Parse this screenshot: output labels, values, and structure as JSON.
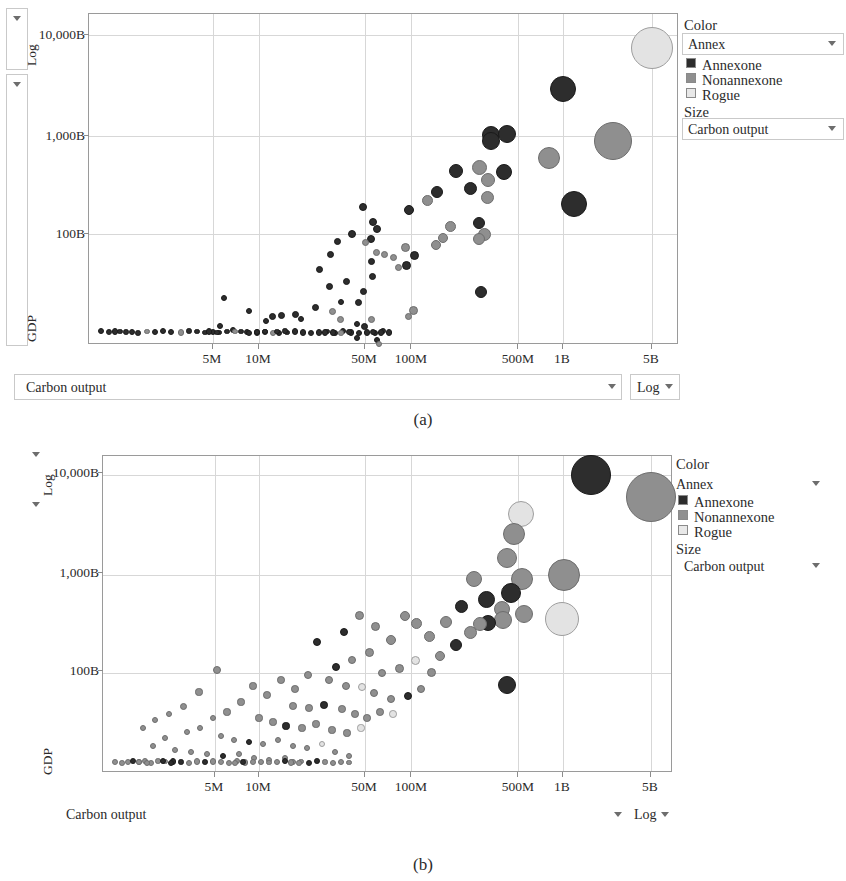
{
  "figure": {
    "captions": [
      "(a)",
      "(b)"
    ]
  },
  "panels": [
    {
      "id": "panel-a",
      "caption": "(a)",
      "axis": {
        "y_label": "GDP",
        "y_scale": "Log",
        "y_scale_caret": "▾",
        "y_ticks": [
          "10,000B",
          "1,000B",
          "100B"
        ],
        "x_label": "Carbon output",
        "x_scale": "Log",
        "x_scale_caret": "▾",
        "x_field_caret": "▾",
        "x_ticks": [
          "5M",
          "10M",
          "50M",
          "100M",
          "500M",
          "1B",
          "5B"
        ]
      },
      "legend": {
        "color_title": "Color",
        "color_field": "Annex",
        "color_caret": "▾",
        "categories": [
          "Annexone",
          "Nonannexone",
          "Rogue"
        ],
        "size_title": "Size",
        "size_field": "Carbon output",
        "size_caret": "▾"
      }
    },
    {
      "id": "panel-b",
      "caption": "(b)",
      "axis": {
        "y_label": "GDP",
        "y_scale": "Log",
        "y_scale_caret": "▾",
        "y_ticks": [
          "10,000B",
          "1,000B",
          "100B"
        ],
        "x_label": "Carbon output",
        "x_scale": "Log",
        "x_scale_caret": "▾",
        "x_field_caret": "▾",
        "x_ticks": [
          "5M",
          "10M",
          "50M",
          "100M",
          "500M",
          "1B",
          "5B"
        ]
      },
      "legend": {
        "color_title": "Color",
        "color_field": "Annex",
        "color_caret": "▾",
        "categories": [
          "Annexone",
          "Nonannexone",
          "Rogue"
        ],
        "size_title": "Size",
        "size_field": "Carbon output",
        "size_caret": "▾"
      }
    }
  ],
  "colors": {
    "annexone": "#2d2d2d",
    "nonannexone": "#8f8f8f",
    "rogue": "#e3e3e3",
    "grid": "#d7d7d7",
    "axis": "#9a9a9a",
    "text": "#2b2b2b"
  },
  "chart_data": [
    {
      "type": "scatter",
      "subplot": "(a)",
      "title": "",
      "xlabel": "Carbon output",
      "ylabel": "GDP",
      "xscale": "log",
      "yscale": "log",
      "xtick_labels": [
        "5M",
        "10M",
        "50M",
        "100M",
        "500M",
        "1B",
        "5B"
      ],
      "xtick_values": [
        5000000,
        10000000,
        50000000,
        100000000,
        500000000,
        1000000000,
        5000000000
      ],
      "ytick_labels": [
        "10,000B",
        "1,000B",
        "100B"
      ],
      "ytick_values": [
        10000,
        1000,
        100
      ],
      "grid": true,
      "legend_position": "right",
      "size_encoding": "Carbon output",
      "color_encoding": "Annex",
      "series": [
        {
          "name": "Annexone",
          "color": "#2d2d2d"
        },
        {
          "name": "Nonannexone",
          "color": "#8f8f8f"
        },
        {
          "name": "Rogue",
          "color": "#e3e3e3"
        }
      ],
      "points": [
        {
          "x": 0.0,
          "y": 1.5,
          "r": 4.2,
          "c": "rogue",
          "note": "top-right giant bubble 5B / ~8,000B"
        },
        {
          "x": 562,
          "y": 75,
          "r": 13,
          "c": "annexone"
        },
        {
          "x": 612,
          "y": 127,
          "r": 19,
          "c": "nonannexone"
        },
        {
          "x": 548,
          "y": 144,
          "r": 11,
          "c": "nonannexone"
        },
        {
          "x": 573,
          "y": 190,
          "r": 13,
          "c": "annexone"
        },
        {
          "x": 490,
          "y": 121,
          "r": 9,
          "c": "annexone"
        },
        {
          "x": 506,
          "y": 120,
          "r": 9,
          "c": "annexone"
        },
        {
          "x": 490,
          "y": 125,
          "r": 9,
          "c": "annexone"
        },
        {
          "x": 478,
          "y": 153,
          "r": 7,
          "c": "nonannexone"
        },
        {
          "x": 503,
          "y": 158,
          "r": 8,
          "c": "annexone"
        },
        {
          "x": 455,
          "y": 157,
          "r": 7,
          "c": "annexone"
        },
        {
          "x": 487,
          "y": 165,
          "r": 7,
          "c": "nonannexone"
        },
        {
          "x": 469,
          "y": 173,
          "r": 6.5,
          "c": "annexone"
        },
        {
          "x": 486,
          "y": 182,
          "r": 6.5,
          "c": "nonannexone"
        },
        {
          "x": 436,
          "y": 178,
          "r": 6,
          "c": "annexone"
        },
        {
          "x": 426,
          "y": 185,
          "r": 5.5,
          "c": "nonannexone"
        },
        {
          "x": 408,
          "y": 195,
          "r": 5,
          "c": "annexone"
        },
        {
          "x": 449,
          "y": 212,
          "r": 5.5,
          "c": "nonannexone"
        },
        {
          "x": 478,
          "y": 209,
          "r": 6,
          "c": "annexone"
        },
        {
          "x": 483,
          "y": 220,
          "r": 6.5,
          "c": "nonannexone"
        },
        {
          "x": 478,
          "y": 224,
          "r": 6,
          "c": "nonannexone"
        },
        {
          "x": 442,
          "y": 224,
          "r": 5,
          "c": "nonannexone"
        },
        {
          "x": 435,
          "y": 231,
          "r": 5,
          "c": "nonannexone"
        },
        {
          "x": 404,
          "y": 233,
          "r": 4.5,
          "c": "nonannexone"
        },
        {
          "x": 413,
          "y": 241,
          "r": 4.5,
          "c": "annexone"
        },
        {
          "x": 405,
          "y": 251,
          "r": 4.5,
          "c": "annexone"
        },
        {
          "x": 480,
          "y": 278,
          "r": 6,
          "c": "annexone"
        },
        {
          "x": 412,
          "y": 296,
          "r": 4.5,
          "c": "nonannexone"
        },
        {
          "x": 362,
          "y": 193,
          "r": 4,
          "c": "annexone"
        },
        {
          "x": 372,
          "y": 208,
          "r": 4,
          "c": "annexone"
        },
        {
          "x": 376,
          "y": 215,
          "r": 4,
          "c": "annexone"
        },
        {
          "x": 351,
          "y": 220,
          "r": 4,
          "c": "annexone"
        },
        {
          "x": 370,
          "y": 225,
          "r": 4,
          "c": "annexone"
        },
        {
          "x": 364,
          "y": 227,
          "r": 3.5,
          "c": "nonannexone"
        },
        {
          "x": 336,
          "y": 227,
          "r": 3.5,
          "c": "annexone"
        },
        {
          "x": 375,
          "y": 238,
          "r": 3.5,
          "c": "nonannexone"
        },
        {
          "x": 383,
          "y": 240,
          "r": 3.5,
          "c": "nonannexone"
        },
        {
          "x": 329,
          "y": 240,
          "r": 3.5,
          "c": "annexone"
        },
        {
          "x": 392,
          "y": 243,
          "r": 3.5,
          "c": "nonannexone"
        },
        {
          "x": 370,
          "y": 247,
          "r": 3.5,
          "c": "annexone"
        },
        {
          "x": 397,
          "y": 253,
          "r": 3.5,
          "c": "nonannexone"
        },
        {
          "x": 318,
          "y": 255,
          "r": 3.5,
          "c": "annexone"
        },
        {
          "x": 371,
          "y": 262,
          "r": 3.5,
          "c": "annexone"
        },
        {
          "x": 345,
          "y": 267,
          "r": 3.5,
          "c": "annexone"
        },
        {
          "x": 328,
          "y": 272,
          "r": 3.5,
          "c": "annexone"
        },
        {
          "x": 362,
          "y": 277,
          "r": 3.5,
          "c": "annexone"
        },
        {
          "x": 357,
          "y": 288,
          "r": 3.5,
          "c": "annexone"
        },
        {
          "x": 314,
          "y": 293,
          "r": 3.5,
          "c": "annexone"
        },
        {
          "x": 331,
          "y": 297,
          "r": 3.5,
          "c": "nonannexone"
        },
        {
          "x": 407,
          "y": 302,
          "r": 3.5,
          "c": "nonannexone"
        },
        {
          "x": 370,
          "y": 305,
          "r": 3.5,
          "c": "nonannexone"
        },
        {
          "x": 339,
          "y": 305,
          "r": 3.5,
          "c": "nonannexone"
        },
        {
          "x": 363,
          "y": 312,
          "r": 3.5,
          "c": "annexone"
        },
        {
          "x": 294,
          "y": 300,
          "r": 3.5,
          "c": "annexone"
        },
        {
          "x": 280,
          "y": 300,
          "r": 3.5,
          "c": "annexone"
        },
        {
          "x": 271,
          "y": 302,
          "r": 3.5,
          "c": "annexone"
        },
        {
          "x": 300,
          "y": 305,
          "r": 3.2,
          "c": "annexone"
        },
        {
          "x": 265,
          "y": 307,
          "r": 3.2,
          "c": "annexone"
        },
        {
          "x": 248,
          "y": 297,
          "r": 3.2,
          "c": "annexone"
        },
        {
          "x": 223,
          "y": 284,
          "r": 3.2,
          "c": "annexone"
        },
        {
          "x": 219,
          "y": 312,
          "r": 3.2,
          "c": "annexone"
        },
        {
          "x": 232,
          "y": 316,
          "r": 3.2,
          "c": "annexone"
        },
        {
          "x": 246,
          "y": 318,
          "r": 3.2,
          "c": "annexone"
        },
        {
          "x": 356,
          "y": 324,
          "r": 3.2,
          "c": "annexone"
        },
        {
          "x": 376,
          "y": 326,
          "r": 3.2,
          "c": "annexone"
        },
        {
          "x": 378,
          "y": 331,
          "r": 3.2,
          "c": "nonannexone"
        },
        {
          "x": 100,
          "y": 331,
          "r": 3,
          "c": "annexone"
        },
        {
          "x": 110,
          "y": 331,
          "r": 3,
          "c": "annexone"
        },
        {
          "x": 120,
          "y": 331,
          "r": 3,
          "c": "annexone"
        },
        {
          "x": 131,
          "y": 331,
          "r": 3,
          "c": "annexone"
        },
        {
          "x": 142,
          "y": 331,
          "r": 3,
          "c": "annexone"
        },
        {
          "x": 155,
          "y": 331,
          "r": 3,
          "c": "annexone"
        },
        {
          "x": 166,
          "y": 331,
          "r": 3,
          "c": "annexone"
        },
        {
          "x": 176,
          "y": 331,
          "r": 3,
          "c": "annexone"
        },
        {
          "x": 187,
          "y": 331,
          "r": 3,
          "c": "annexone"
        },
        {
          "x": 198,
          "y": 331,
          "r": 3,
          "c": "annexone"
        },
        {
          "x": 209,
          "y": 331,
          "r": 3,
          "c": "annexone"
        },
        {
          "x": 222,
          "y": 331,
          "r": 3,
          "c": "annexone"
        },
        {
          "x": 236,
          "y": 331,
          "r": 3,
          "c": "annexone"
        },
        {
          "x": 250,
          "y": 331,
          "r": 3,
          "c": "annexone"
        },
        {
          "x": 263,
          "y": 331,
          "r": 3,
          "c": "nonannexone"
        },
        {
          "x": 278,
          "y": 331,
          "r": 3,
          "c": "annexone"
        },
        {
          "x": 290,
          "y": 331,
          "r": 3,
          "c": "nonannexone"
        },
        {
          "x": 310,
          "y": 331,
          "r": 3,
          "c": "annexone"
        },
        {
          "x": 330,
          "y": 331,
          "r": 3,
          "c": "annexone"
        },
        {
          "x": 354,
          "y": 331,
          "r": 3,
          "c": "annexone"
        }
      ]
    },
    {
      "type": "scatter",
      "subplot": "(b)",
      "title": "",
      "xlabel": "Carbon output",
      "ylabel": "GDP",
      "xscale": "log",
      "yscale": "log",
      "xtick_labels": [
        "5M",
        "10M",
        "50M",
        "100M",
        "500M",
        "1B",
        "5B"
      ],
      "xtick_values": [
        5000000,
        10000000,
        50000000,
        100000000,
        500000000,
        1000000000,
        5000000000
      ],
      "ytick_labels": [
        "10,000B",
        "1,000B",
        "100B"
      ],
      "ytick_values": [
        10000,
        1000,
        100
      ],
      "grid": true,
      "legend_position": "right",
      "size_encoding": "Carbon output",
      "color_encoding": "Annex",
      "series": [
        {
          "name": "Annexone",
          "color": "#2d2d2d"
        },
        {
          "name": "Nonannexone",
          "color": "#8f8f8f"
        },
        {
          "name": "Rogue",
          "color": "#e3e3e3"
        }
      ],
      "points": []
    }
  ]
}
